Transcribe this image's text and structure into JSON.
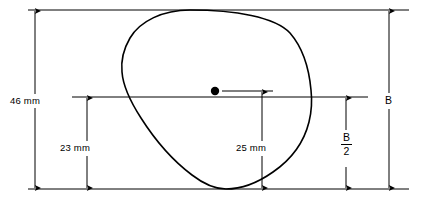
{
  "diagram": {
    "stroke_color": "#000000",
    "background_color": "#ffffff",
    "profile_name": "cam-profile-outline",
    "center_point_name": "center-dot",
    "dimensions": [
      {
        "id": "overall-height-left",
        "label": "46 mm",
        "orientation": "vertical",
        "from": "top-reference-line",
        "to": "bottom-reference-line"
      },
      {
        "id": "lower-half-left",
        "label": "23 mm",
        "orientation": "vertical",
        "from": "center-reference-line",
        "to": "bottom-reference-line"
      },
      {
        "id": "lower-offset-center",
        "label": "25 mm",
        "orientation": "vertical",
        "from": "center-reference-line",
        "to": "bottom-reference-line"
      },
      {
        "id": "overall-height-right",
        "label": "B",
        "orientation": "vertical",
        "from": "top-reference-line",
        "to": "bottom-reference-line"
      },
      {
        "id": "half-height-right",
        "label": "B/2",
        "numerator": "B",
        "denominator": "2",
        "orientation": "vertical",
        "from": "center-reference-line",
        "to": "bottom-reference-line"
      }
    ]
  }
}
